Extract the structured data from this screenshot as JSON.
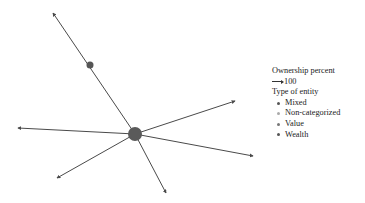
{
  "legend": {
    "ownership_title": "Ownership percent",
    "ownership_value": "100",
    "type_title": "Type of entity",
    "types": [
      {
        "label": "Mixed",
        "color": "#555555"
      },
      {
        "label": "Non-categorized",
        "color": "#aaaaaa"
      },
      {
        "label": "Value",
        "color": "#777777"
      },
      {
        "label": "Wealth",
        "color": "#555555"
      }
    ]
  },
  "graph": {
    "edge_color": "#4a4a4a",
    "nodes": [
      {
        "id": "center",
        "x": 135,
        "y": 134,
        "r": 7,
        "color": "#5a5a5a"
      },
      {
        "id": "mid",
        "x": 90,
        "y": 65,
        "r": 3.5,
        "color": "#555555"
      }
    ],
    "edges": [
      {
        "from": [
          135,
          134
        ],
        "to": [
          53,
          13
        ]
      },
      {
        "from": [
          135,
          134
        ],
        "to": [
          235,
          101
        ]
      },
      {
        "from": [
          135,
          134
        ],
        "to": [
          18,
          128
        ]
      },
      {
        "from": [
          135,
          134
        ],
        "to": [
          253,
          156
        ]
      },
      {
        "from": [
          135,
          134
        ],
        "to": [
          57,
          178
        ]
      },
      {
        "from": [
          135,
          134
        ],
        "to": [
          166,
          193
        ]
      }
    ]
  }
}
